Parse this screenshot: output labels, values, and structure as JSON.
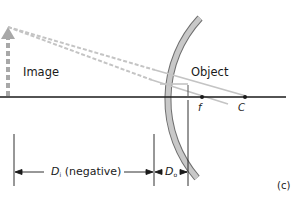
{
  "figure": {
    "panel_label": "(c)",
    "labels": {
      "image": "Image",
      "object": "Object",
      "focal_point": "f",
      "center_of_curvature": "C",
      "image_distance_symbol": "D",
      "image_distance_subscript": "i",
      "image_distance_note": "(negative)",
      "object_distance_symbol": "D",
      "object_distance_subscript": "o"
    },
    "colors": {
      "axis": "#1a1a1a",
      "mirror_fill": "#c8c8c8",
      "mirror_stroke": "#6e6e6e",
      "rays": "#c4c4c4",
      "virtual_rays": "#c4c4c4",
      "image_arrow": "#a8a8a8",
      "dimension_lines": "#1a1a1a"
    }
  }
}
